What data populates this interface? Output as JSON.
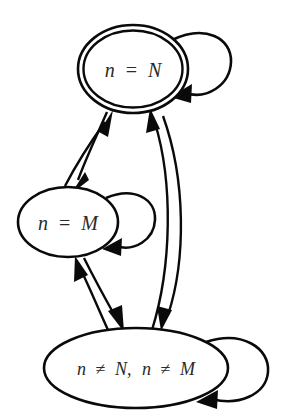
{
  "diagram": {
    "type": "finite-state-machine",
    "background_color": "#ffffff",
    "stroke_color": "#0a0a0a",
    "label_color": "#2a2a2a",
    "nodes": [
      {
        "id": "state-n-equals-N",
        "label": "n = N",
        "label_var1": "n",
        "label_op": "=",
        "label_var2": "N",
        "shape": "double-ellipse",
        "accepting": true,
        "cx": 133,
        "cy": 69,
        "rx": 55,
        "ry": 44
      },
      {
        "id": "state-n-equals-M",
        "label": "n = M",
        "label_var1": "n",
        "label_op": "=",
        "label_var2": "M",
        "shape": "ellipse",
        "accepting": false,
        "cx": 68,
        "cy": 222,
        "rx": 50,
        "ry": 35
      },
      {
        "id": "state-n-not-N-not-M",
        "label": "n ≠ N, n ≠ M",
        "label_part1": "n",
        "label_op1": "≠",
        "label_part2": "N,",
        "label_part3": "n",
        "label_op2": "≠",
        "label_part4": "M",
        "shape": "ellipse",
        "accepting": false,
        "cx": 136,
        "cy": 368,
        "rx": 92,
        "ry": 40
      }
    ],
    "edges": [
      {
        "id": "edge-N-to-M",
        "from": "state-n-equals-N",
        "to": "state-n-equals-M",
        "kind": "curve",
        "arrow": "target"
      },
      {
        "id": "edge-M-to-N",
        "from": "state-n-equals-M",
        "to": "state-n-equals-N",
        "kind": "curve",
        "arrow": "target"
      },
      {
        "id": "edge-N-to-other",
        "from": "state-n-equals-N",
        "to": "state-n-not-N-not-M",
        "kind": "curve",
        "arrow": "target"
      },
      {
        "id": "edge-other-to-N",
        "from": "state-n-not-N-not-M",
        "to": "state-n-equals-N",
        "kind": "curve",
        "arrow": "target"
      },
      {
        "id": "edge-M-to-other",
        "from": "state-n-equals-M",
        "to": "state-n-not-N-not-M",
        "kind": "curve",
        "arrow": "target"
      },
      {
        "id": "edge-other-to-M",
        "from": "state-n-not-N-not-M",
        "to": "state-n-equals-M",
        "kind": "curve",
        "arrow": "target"
      },
      {
        "id": "self-loop-N",
        "from": "state-n-equals-N",
        "to": "state-n-equals-N",
        "kind": "self-loop",
        "arrow": "target"
      },
      {
        "id": "self-loop-M",
        "from": "state-n-equals-M",
        "to": "state-n-equals-M",
        "kind": "self-loop",
        "arrow": "target"
      },
      {
        "id": "self-loop-other",
        "from": "state-n-not-N-not-M",
        "to": "state-n-not-N-not-M",
        "kind": "self-loop",
        "arrow": "target"
      }
    ]
  }
}
